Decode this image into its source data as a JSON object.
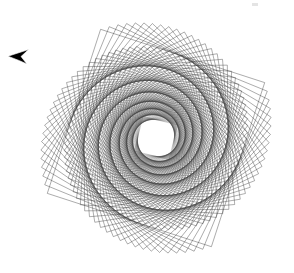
{
  "canvas": {
    "width": 294,
    "height": 273,
    "background_color": "#ffffff",
    "title": "Rotating Square Spiral Pattern"
  },
  "artwork": {
    "name": "rotating-square-spirograph",
    "type": "turtle-graphics-spiral",
    "description": "Nested squares progressively rotated and scaled producing four dark spiral arms",
    "stroke_color": "#3a3a3a",
    "stroke_width": 0.45,
    "fill": "none",
    "center_x": 156,
    "center_y": 138,
    "start_size": 122,
    "shape_sides": 4,
    "iterations": 150,
    "rotation_step_deg": 4.2,
    "scale_step": 0.9895,
    "base_rotation_deg": 18,
    "opacity_start": 0.95,
    "opacity_end": 0.55
  },
  "cursor": {
    "name": "mouse-pointer",
    "glyph": "arrow-left",
    "x": 8,
    "y": 49,
    "width": 21,
    "height": 15,
    "fill_color": "#000000",
    "outline_color": "#ffffff"
  },
  "artifact": {
    "name": "faint-mark",
    "x": 252,
    "y": 3,
    "color": "#d9d9d9"
  },
  "chart_data": {
    "type": "scatter",
    "xlabel": "",
    "ylabel": "",
    "series": [
      {
        "name": "square-envelope",
        "shape": "square",
        "count": 150,
        "rotation_step_deg": 4.2,
        "scale_step": 0.9895,
        "start_size": 122,
        "center": [
          156,
          138
        ]
      }
    ],
    "grid": false,
    "legend": "none"
  }
}
